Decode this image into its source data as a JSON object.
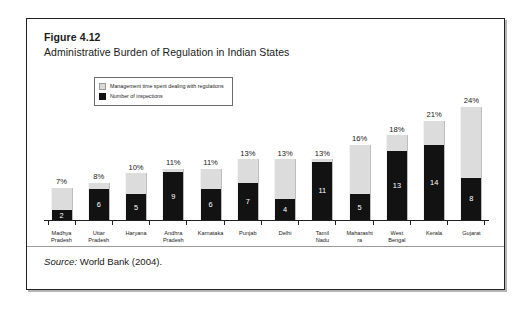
{
  "figure": {
    "number": "Figure 4.12",
    "title": "Administrative Burden of Regulation in Indian States",
    "source_prefix": "Source:",
    "source_text": " World Bank (2004)."
  },
  "legend": {
    "items": [
      {
        "label": "Management time spent dealing with regulations",
        "color": "#d9d9d9",
        "swatch": "gray-swatch"
      },
      {
        "label": "Number of inspections",
        "color": "#121212",
        "swatch": "black-swatch"
      }
    ]
  },
  "chart_data": {
    "type": "bar",
    "title": "Administrative Burden of Regulation in Indian States",
    "xlabel": "",
    "ylabel": "",
    "grid": false,
    "legend_position": "top-left",
    "note": "Grouped/overlaid bar: light gray column height encodes management time (percent); black column rising from the baseline encodes number of inspections.",
    "categories": [
      "Madhya Pradesh",
      "Uttar Pradesh",
      "Haryana",
      "Andhra Pradesh",
      "Karnataka",
      "Punjab",
      "Delhi",
      "Tamil Nadu",
      "Maharashtra",
      "West Bengal",
      "Kerala",
      "Gujarat"
    ],
    "series": [
      {
        "name": "Management time spent dealing with regulations",
        "unit": "%",
        "color": "#d9d9d9",
        "values": [
          7,
          8,
          10,
          11,
          11,
          13,
          13,
          13,
          16,
          18,
          21,
          24
        ],
        "value_labels": [
          "7%",
          "8%",
          "10%",
          "11%",
          "11%",
          "13%",
          "13%",
          "13%",
          "16%",
          "18%",
          "21%",
          "24%"
        ]
      },
      {
        "name": "Number of inspections",
        "unit": "",
        "color": "#121212",
        "values": [
          2,
          6,
          5,
          9,
          6,
          7,
          4,
          11,
          5,
          13,
          14,
          8
        ],
        "value_labels": [
          "2",
          "6",
          "5",
          "9",
          "6",
          "7",
          "4",
          "11",
          "5",
          "13",
          "14",
          "8"
        ]
      }
    ],
    "ylim_percent": [
      0,
      24
    ],
    "ylim_inspections": [
      0,
      14
    ]
  }
}
